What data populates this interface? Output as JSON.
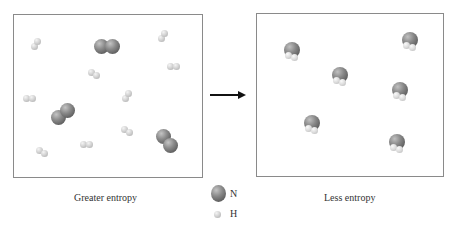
{
  "diagram": {
    "left_panel": {
      "caption": "Greater entropy",
      "n2_molecules": [
        {
          "x": 107,
          "y": 46,
          "angle": 0
        },
        {
          "x": 63,
          "y": 114,
          "angle": -40
        },
        {
          "x": 167,
          "y": 141,
          "angle": 50
        }
      ],
      "h2_molecules": [
        {
          "x": 36,
          "y": 44,
          "angle": -50
        },
        {
          "x": 163,
          "y": 36,
          "angle": -50
        },
        {
          "x": 94,
          "y": 74,
          "angle": 40
        },
        {
          "x": 173,
          "y": 66,
          "angle": 0
        },
        {
          "x": 29,
          "y": 98,
          "angle": 0
        },
        {
          "x": 127,
          "y": 96,
          "angle": -50
        },
        {
          "x": 127,
          "y": 131,
          "angle": 40
        },
        {
          "x": 86,
          "y": 144,
          "angle": 0
        },
        {
          "x": 42,
          "y": 152,
          "angle": 40
        }
      ]
    },
    "arrow": {
      "direction": "right"
    },
    "right_panel": {
      "caption": "Less entropy",
      "nh3_molecules": [
        {
          "x": 292,
          "y": 50
        },
        {
          "x": 410,
          "y": 40
        },
        {
          "x": 340,
          "y": 75
        },
        {
          "x": 400,
          "y": 90
        },
        {
          "x": 312,
          "y": 123
        },
        {
          "x": 397,
          "y": 142
        }
      ]
    },
    "legend": [
      {
        "symbol": "N",
        "atom": "nitrogen"
      },
      {
        "symbol": "H",
        "atom": "hydrogen"
      }
    ]
  }
}
